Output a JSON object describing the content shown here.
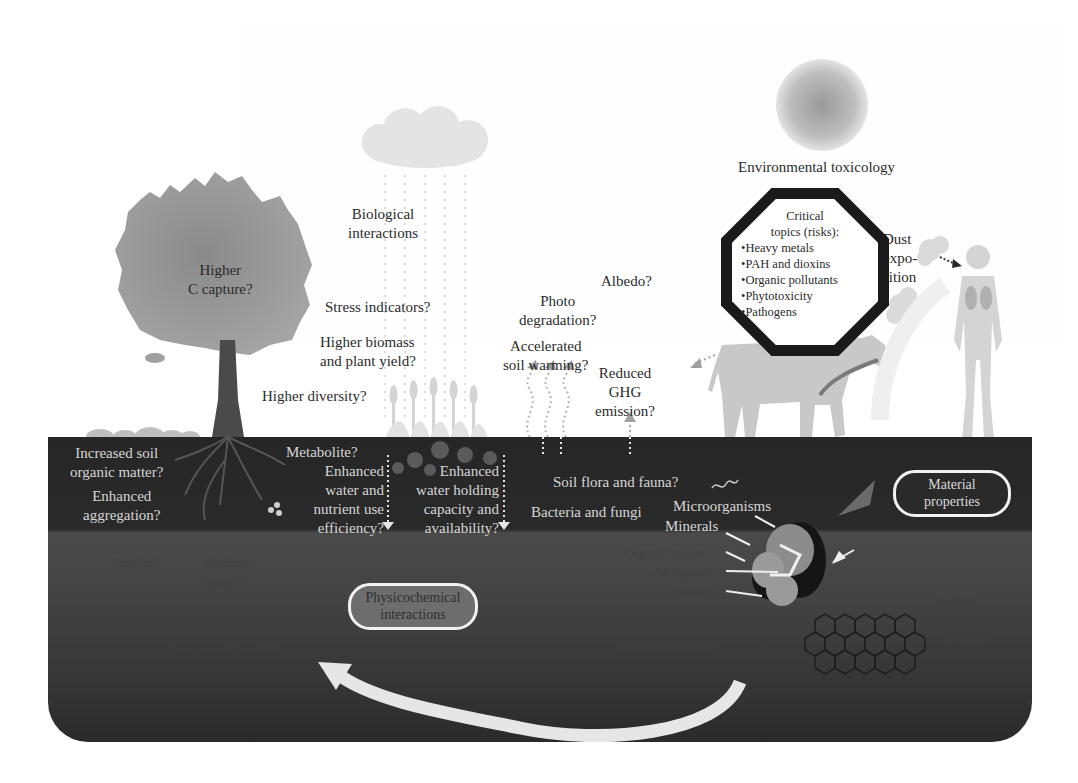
{
  "figure": {
    "colors": {
      "background": "#ffffff",
      "soil_top": "#262626",
      "soil_bottom": "#3a3a3a",
      "label_dark": "#2b2b2b",
      "label_light": "#d6d6d6",
      "arrow": "#e6e6e6"
    },
    "above_ground": {
      "tree_label": [
        "Higher",
        "C capture?"
      ],
      "biological_interactions": [
        "Biological",
        "interactions"
      ],
      "stress_indicators": "Stress indicators?",
      "higher_biomass": [
        "Higher biomass",
        "and plant yield?"
      ],
      "higher_diversity": "Higher diversity?",
      "albedo": "Albedo?",
      "photo_degradation": [
        "Photo",
        "degradation?"
      ],
      "soil_warming": [
        "Accelerated",
        "soil warming?"
      ],
      "ghg": [
        "Reduced",
        "GHG",
        "emission?"
      ],
      "environmental_toxicology": "Environmental toxicology",
      "dust_exposition": [
        "Dust",
        "expo-",
        "sition"
      ]
    },
    "octagon": {
      "heading": [
        "Critical",
        "topics (risks):"
      ],
      "items": [
        "Heavy metals",
        "PAH and dioxins",
        "Organic pollutants",
        "Phytotoxicity",
        "Pathogens"
      ]
    },
    "topsoil": {
      "soil_organic_matter": [
        "Increased soil",
        "organic matter?"
      ],
      "aggregation": [
        "Enhanced",
        "aggregation?"
      ],
      "metabolite": "Metabolite?",
      "water_nutrient": [
        "Enhanced",
        "water and",
        "nutrient use",
        "efficiency?"
      ],
      "water_holding": [
        "Enhanced",
        "water holding",
        "capacity and",
        "availability?"
      ],
      "soil_flora": "Soil flora and fauna?",
      "bacteria_fungi": "Bacteria and fungi",
      "microorganisms": "Microorganisms",
      "minerals": "Minerals",
      "material_properties": [
        "Material",
        "properties"
      ]
    },
    "subsoil": {
      "erosion": "Erosion?",
      "nutrient_runoff": [
        "Nutrient",
        "runoff?"
      ],
      "physicochemical": [
        "Physicochemical",
        "interactions"
      ],
      "long_term": "Long-term C stock?",
      "organic_matter": "Organic matter",
      "air_spaces": "Air spaces",
      "water": "Water",
      "hydrophobicity": "Hydrophobicity?",
      "water_repellency": "Water repellency?",
      "surface": "Surface",
      "porosity": "Porosity"
    }
  }
}
